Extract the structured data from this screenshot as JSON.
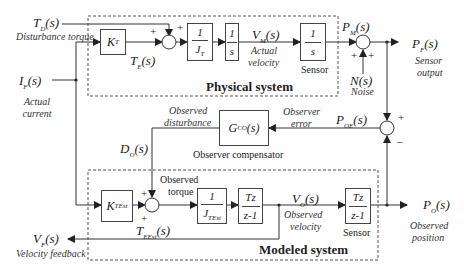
{
  "groups": {
    "physical": "Physical system",
    "modeled": "Modeled system"
  },
  "signals": {
    "td": {
      "main": "T",
      "sub": "D",
      "tail": "(s)",
      "desc": "Disturbance torque"
    },
    "if": {
      "main": "I",
      "sub": "F",
      "tail": "(s)",
      "desc": "Actual current"
    },
    "te": {
      "main": "T",
      "sub": "E",
      "tail": "(s)"
    },
    "vm": {
      "main": "V",
      "sub": "M",
      "tail": "(s)",
      "desc1": "Actual",
      "desc2": "velocity"
    },
    "pm": {
      "main": "P",
      "sub": "M",
      "tail": "(s)"
    },
    "pf": {
      "main": "P",
      "sub": "F",
      "tail": "(s)",
      "desc1": "Sensor",
      "desc2": "output"
    },
    "ns": {
      "main": "N(s)",
      "desc": "Noise"
    },
    "poe": {
      "main": "P",
      "sub": "OE",
      "tail": "(s)",
      "desc1": "Observer",
      "desc2": "error"
    },
    "do": {
      "main": "D",
      "sub": "O",
      "tail": "(s)",
      "desc1": "Observed",
      "desc2": "disturbance"
    },
    "obs_torque": {
      "desc1": "Observed",
      "desc2": "torque"
    },
    "teest": {
      "main": "T",
      "sub": "EEst",
      "tail": "(s)"
    },
    "vo": {
      "main": "V",
      "sub": "O",
      "tail": "(s)",
      "desc1": "Observed",
      "desc2": "velocity"
    },
    "po": {
      "main": "P",
      "sub": "O",
      "tail": "(s)",
      "desc1": "Observed",
      "desc2": "position"
    },
    "vf": {
      "main": "V",
      "sub": "F",
      "tail": "(s)",
      "desc": "Velocity feedback"
    }
  },
  "blocks": {
    "kt": {
      "main": "K",
      "sub": "T"
    },
    "jt": {
      "num": "1",
      "den_main": "J",
      "den_sub": "T"
    },
    "int1": {
      "num": "1",
      "den": "s"
    },
    "sensor_phys": {
      "num": "1",
      "den": "s",
      "caption": "Sensor"
    },
    "gco": {
      "main": "G",
      "sub": "CO",
      "tail": "(s)",
      "caption": "Observer compensator"
    },
    "ktest": {
      "main": "K",
      "sub": "TEst"
    },
    "jtest": {
      "num": "1",
      "den_main": "J",
      "den_sub": "TEst"
    },
    "int_d": {
      "num": "Tz",
      "den": "z-1"
    },
    "sensor_mod": {
      "num": "Tz",
      "den": "z-1",
      "caption": "Sensor"
    }
  },
  "signs": {
    "plus": "+",
    "minus": "–"
  }
}
